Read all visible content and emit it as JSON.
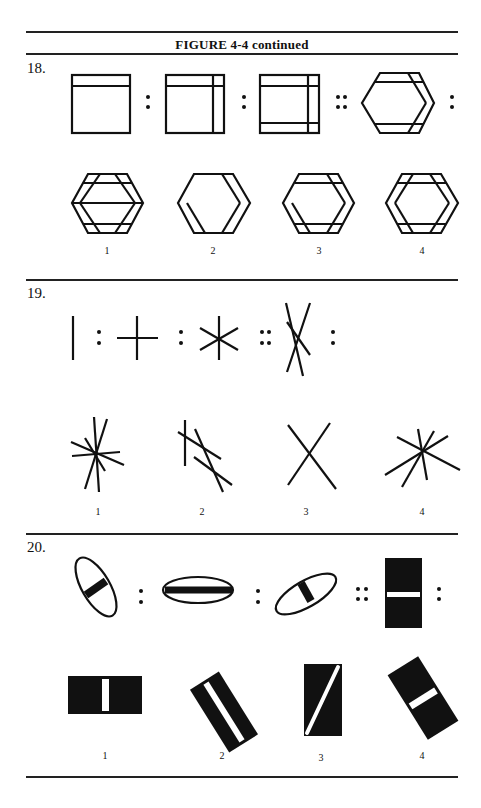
{
  "header": {
    "title": "FIGURE 4-4 continued"
  },
  "questions": [
    {
      "number": "18.",
      "analogy_separators": [
        ":",
        ":",
        "::",
        ":"
      ],
      "stem_description": [
        "square with top band",
        "square with top band and right band",
        "square with top, bottom and right bands",
        "hexagon with top, bottom and right-side bands"
      ],
      "options": [
        {
          "label": "1",
          "description": "hexagon with bands on all sides and a horizontal middle line"
        },
        {
          "label": "2",
          "description": "hexagon with bands on left and right sides"
        },
        {
          "label": "3",
          "description": "hexagon with bands on top, bottom, left and right sides"
        },
        {
          "label": "4",
          "description": "hexagon with bands on all six sides"
        }
      ]
    },
    {
      "number": "19.",
      "analogy_separators": [
        ":",
        ":",
        "::",
        ":"
      ],
      "stem_description": [
        "single vertical line",
        "cross of two lines",
        "six-ray star of three lines",
        "two crossing slanted lines"
      ],
      "options": [
        {
          "label": "1",
          "description": "starburst of many lines"
        },
        {
          "label": "2",
          "description": "one vertical line with three offset slanted lines"
        },
        {
          "label": "3",
          "description": "X of two lines"
        },
        {
          "label": "4",
          "description": "starburst of four lines"
        }
      ]
    },
    {
      "number": "20.",
      "analogy_separators": [
        ":",
        ":",
        "::",
        ":"
      ],
      "stem_description": [
        "tilted ellipse with short black bar",
        "horizontal ellipse with long black bar",
        "tilted ellipse with short black bar",
        "black rectangle with white horizontal bar"
      ],
      "options": [
        {
          "label": "1",
          "description": "horizontal black rectangle with white vertical bar"
        },
        {
          "label": "2",
          "description": "tilted black rectangle with long white bar"
        },
        {
          "label": "3",
          "description": "black rectangle with white diagonal bar"
        },
        {
          "label": "4",
          "description": "tilted black rectangle with short white bar"
        }
      ]
    }
  ],
  "colors": {
    "ink": "#111111",
    "paper": "#ffffff"
  }
}
